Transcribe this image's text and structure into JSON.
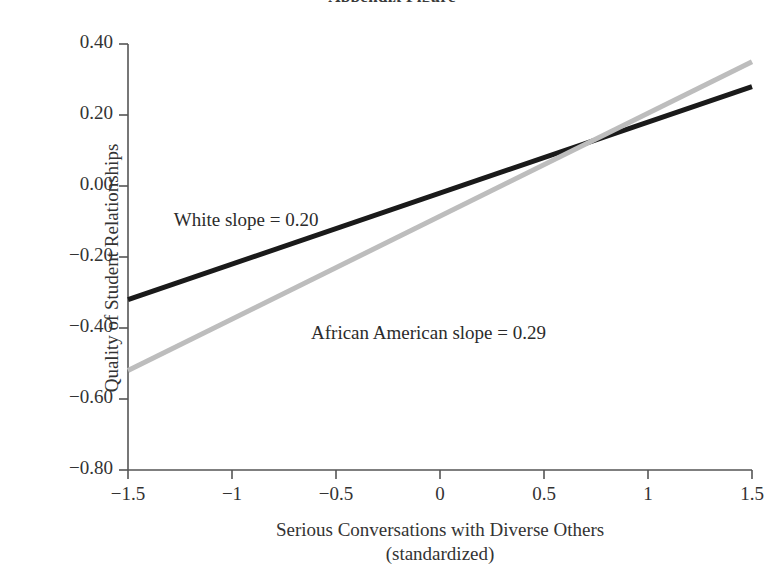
{
  "figure": {
    "title_clipped": "Appendix Figure",
    "background": "#ffffff"
  },
  "chart_data": {
    "type": "line",
    "title": "",
    "xlabel": "Serious Conversations with Diverse Others",
    "xlabel_line2": "(standardized)",
    "ylabel": "Quality of Student Relationships",
    "xlim": [
      -1.5,
      1.5
    ],
    "ylim": [
      -0.8,
      0.4
    ],
    "grid": false,
    "legend": "none (inline annotations)",
    "xticks": [
      -1.5,
      -1,
      -0.5,
      0,
      0.5,
      1,
      1.5
    ],
    "xtick_labels": [
      "−1.5",
      "−1",
      "−0.5",
      "0",
      "0.5",
      "1",
      "1.5"
    ],
    "yticks": [
      0.4,
      0.2,
      0.0,
      -0.2,
      -0.4,
      -0.6,
      -0.8
    ],
    "ytick_labels": [
      "0.40",
      "0.20",
      "0.00",
      "−0.20",
      "−0.40",
      "−0.60",
      "−0.80"
    ],
    "series": [
      {
        "name": "White",
        "slope": 0.2,
        "color": "#1a1a1a",
        "linewidth": 5,
        "x": [
          -1.5,
          1.5
        ],
        "values": [
          -0.32,
          0.28
        ],
        "annotation": "White slope = 0.20"
      },
      {
        "name": "African American",
        "slope": 0.29,
        "color": "#bdbdbd",
        "linewidth": 5,
        "x": [
          -1.5,
          1.5
        ],
        "values": [
          -0.52,
          0.35
        ],
        "annotation": "African American slope = 0.29"
      }
    ],
    "annotations": [
      {
        "text": "White slope = 0.20",
        "x": -1.28,
        "y": -0.1
      },
      {
        "text": "African American slope = 0.29",
        "x": -0.62,
        "y": -0.42
      }
    ]
  },
  "axis": {
    "line_color": "#555555"
  }
}
